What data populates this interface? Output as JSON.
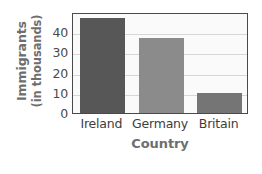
{
  "chart_data": {
    "type": "bar",
    "title": "",
    "categories": [
      "Ireland",
      "Germany",
      "Britain"
    ],
    "values": [
      47,
      37,
      10
    ],
    "series": [
      {
        "name": "Immigrants",
        "values": [
          47,
          37,
          10
        ]
      }
    ],
    "xlabel": "Country",
    "ylabel": "Immigrants (in thousands)",
    "ylabel_lines": [
      "Immigrants",
      "(in thousands)"
    ],
    "ylim": [
      0,
      50
    ],
    "yticks": [
      0,
      10,
      20,
      30,
      40
    ],
    "ytick_labels": [
      "0",
      "10",
      "20",
      "30",
      "40"
    ],
    "grid": true,
    "grid_axis": "y",
    "legend": false,
    "bar_colors": [
      "#575757",
      "#8b8b8b",
      "#757575"
    ],
    "plot_background": "#fafafa",
    "axis_color": "#4a4a4a",
    "gridline_color": "#d6d6d6",
    "axis_title_color": "#6e6e6e",
    "tick_label_color": "#4a4a4a"
  }
}
